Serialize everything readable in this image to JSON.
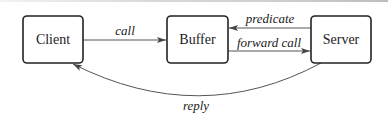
{
  "diagram": {
    "nodes": [
      {
        "id": "client",
        "label": "Client"
      },
      {
        "id": "buffer",
        "label": "Buffer"
      },
      {
        "id": "server",
        "label": "Server"
      }
    ],
    "edges": [
      {
        "from": "client",
        "to": "buffer",
        "label": "call"
      },
      {
        "from": "server",
        "to": "buffer",
        "label": "predicate"
      },
      {
        "from": "buffer",
        "to": "server",
        "label": "forward call"
      },
      {
        "from": "server",
        "to": "client",
        "label": "reply"
      }
    ]
  },
  "colors": {
    "stroke": "#222222",
    "edge": "#555555",
    "background": "#ffffff"
  }
}
